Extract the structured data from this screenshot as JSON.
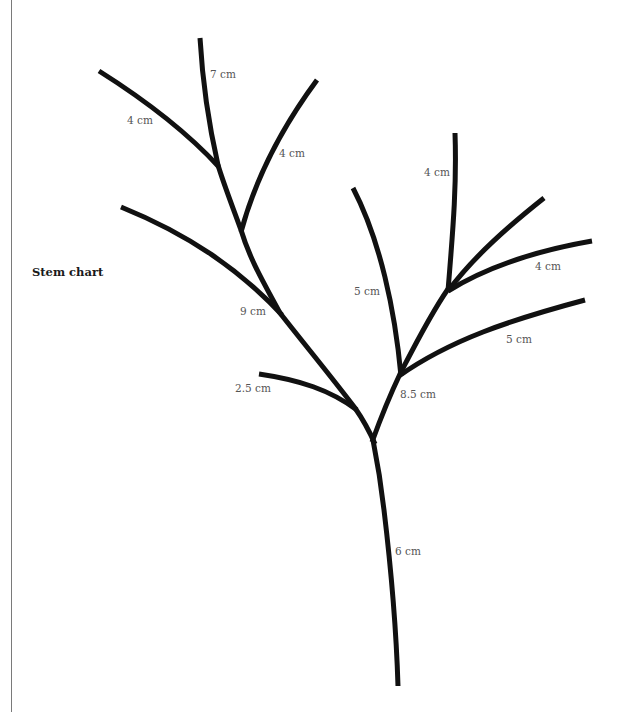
{
  "title": "Stem chart",
  "colors": {
    "stem": "#111111",
    "label": "#555555",
    "title": "#1a1a1a",
    "border": "#7a7a7a",
    "background": "#ffffff"
  },
  "labels": {
    "top_center_7cm": "7 cm",
    "upper_left_4cm": "4 cm",
    "upper_right_4cm": "4 cm",
    "middle_9cm": "9 cm",
    "small_2_5cm": "2.5 cm",
    "right_up_5cm": "5 cm",
    "right_top_4cm": "4 cm",
    "right_side_4cm": "4 cm",
    "right_low_5cm": "5 cm",
    "fork_8_5cm": "8.5 cm",
    "trunk_6cm": "6 cm"
  },
  "segments": [
    {
      "id": "trunk",
      "label": "6 cm"
    },
    {
      "id": "left-main-lower",
      "label": "9 cm"
    },
    {
      "id": "branch-2-5",
      "label": "2.5 cm"
    },
    {
      "id": "branch-left-long",
      "label": ""
    },
    {
      "id": "left-main-upper",
      "label": "7 cm"
    },
    {
      "id": "branch-upper-left",
      "label": "4 cm"
    },
    {
      "id": "branch-upper-right",
      "label": "4 cm"
    },
    {
      "id": "right-main",
      "label": "8.5 cm"
    },
    {
      "id": "branch-right-up",
      "label": "5 cm"
    },
    {
      "id": "branch-right-low",
      "label": "5 cm"
    },
    {
      "id": "branch-right-top",
      "label": "4 cm"
    },
    {
      "id": "branch-right-diag",
      "label": ""
    },
    {
      "id": "branch-right-side",
      "label": "4 cm"
    }
  ]
}
